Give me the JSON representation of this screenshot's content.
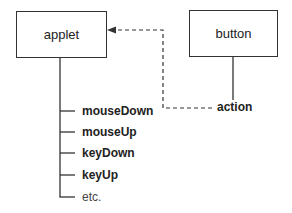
{
  "diagram": {
    "nodes": {
      "applet": {
        "label": "applet"
      },
      "button": {
        "label": "button"
      }
    },
    "applet_events": [
      {
        "label": "mouseDown",
        "bold": true
      },
      {
        "label": "mouseUp",
        "bold": true
      },
      {
        "label": "keyDown",
        "bold": true
      },
      {
        "label": "keyUp",
        "bold": true
      },
      {
        "label": "etc.",
        "bold": false
      }
    ],
    "button_event": {
      "label": "action"
    },
    "edge": {
      "from": "button.action",
      "to": "applet",
      "style": "dashed",
      "arrow": "filled"
    }
  }
}
